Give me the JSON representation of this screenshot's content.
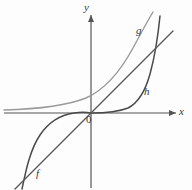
{
  "figure": {
    "background_color": "#fdfdfd"
  },
  "axes": {
    "x_label": "x",
    "y_label": "y",
    "origin_label": "0",
    "color": "#555555",
    "x_axis": {
      "x1": 4,
      "y1": 113,
      "x2": 176,
      "y2": 113
    },
    "y_axis": {
      "x1": 91,
      "y1": 15,
      "x2": 91,
      "y2": 188
    },
    "arrow_x": "right",
    "arrow_y": "up"
  },
  "curves": [
    {
      "name": "f",
      "label": "f",
      "kind": "line",
      "color": "#5a5a5a",
      "width": 1.3,
      "description": "straight line through the origin with positive slope",
      "path": "M 15 189 L 173 31"
    },
    {
      "name": "g",
      "label": "g",
      "kind": "exponential",
      "color": "#9a9a9a",
      "width": 1.4,
      "description": "light gray increasing curve asymptotic to the x-axis on the left, rising steeply on the right",
      "path": "M 4 110 C 40 109 66 106 86 98 C 104 90 120 72 133 48 C 140 35 147 22 153 12"
    },
    {
      "name": "h-left",
      "label": "h",
      "kind": "cubic-s-curve",
      "color": "#4a4a4a",
      "width": 1.5,
      "description": "dark S-shaped branch in the third quadrant flattening toward the x-axis near the origin",
      "path": "M 22 189 C 26 170 30 150 40 135 C 48 123 60 115 74 113 C 80 112 86 112 91 113"
    },
    {
      "name": "h-right",
      "label": "h",
      "kind": "exponential-steep",
      "color": "#4a4a4a",
      "width": 1.5,
      "description": "dark branch hugging the x-axis to the right of the origin then turning sharply upward",
      "path": "M 91 113 C 106 113 118 112 128 108 C 138 103 145 92 150 74 C 155 56 158 36 160 16"
    }
  ],
  "labels": {
    "f": "f",
    "g": "g",
    "h": "h",
    "x": "x",
    "y": "y",
    "origin": "0"
  }
}
